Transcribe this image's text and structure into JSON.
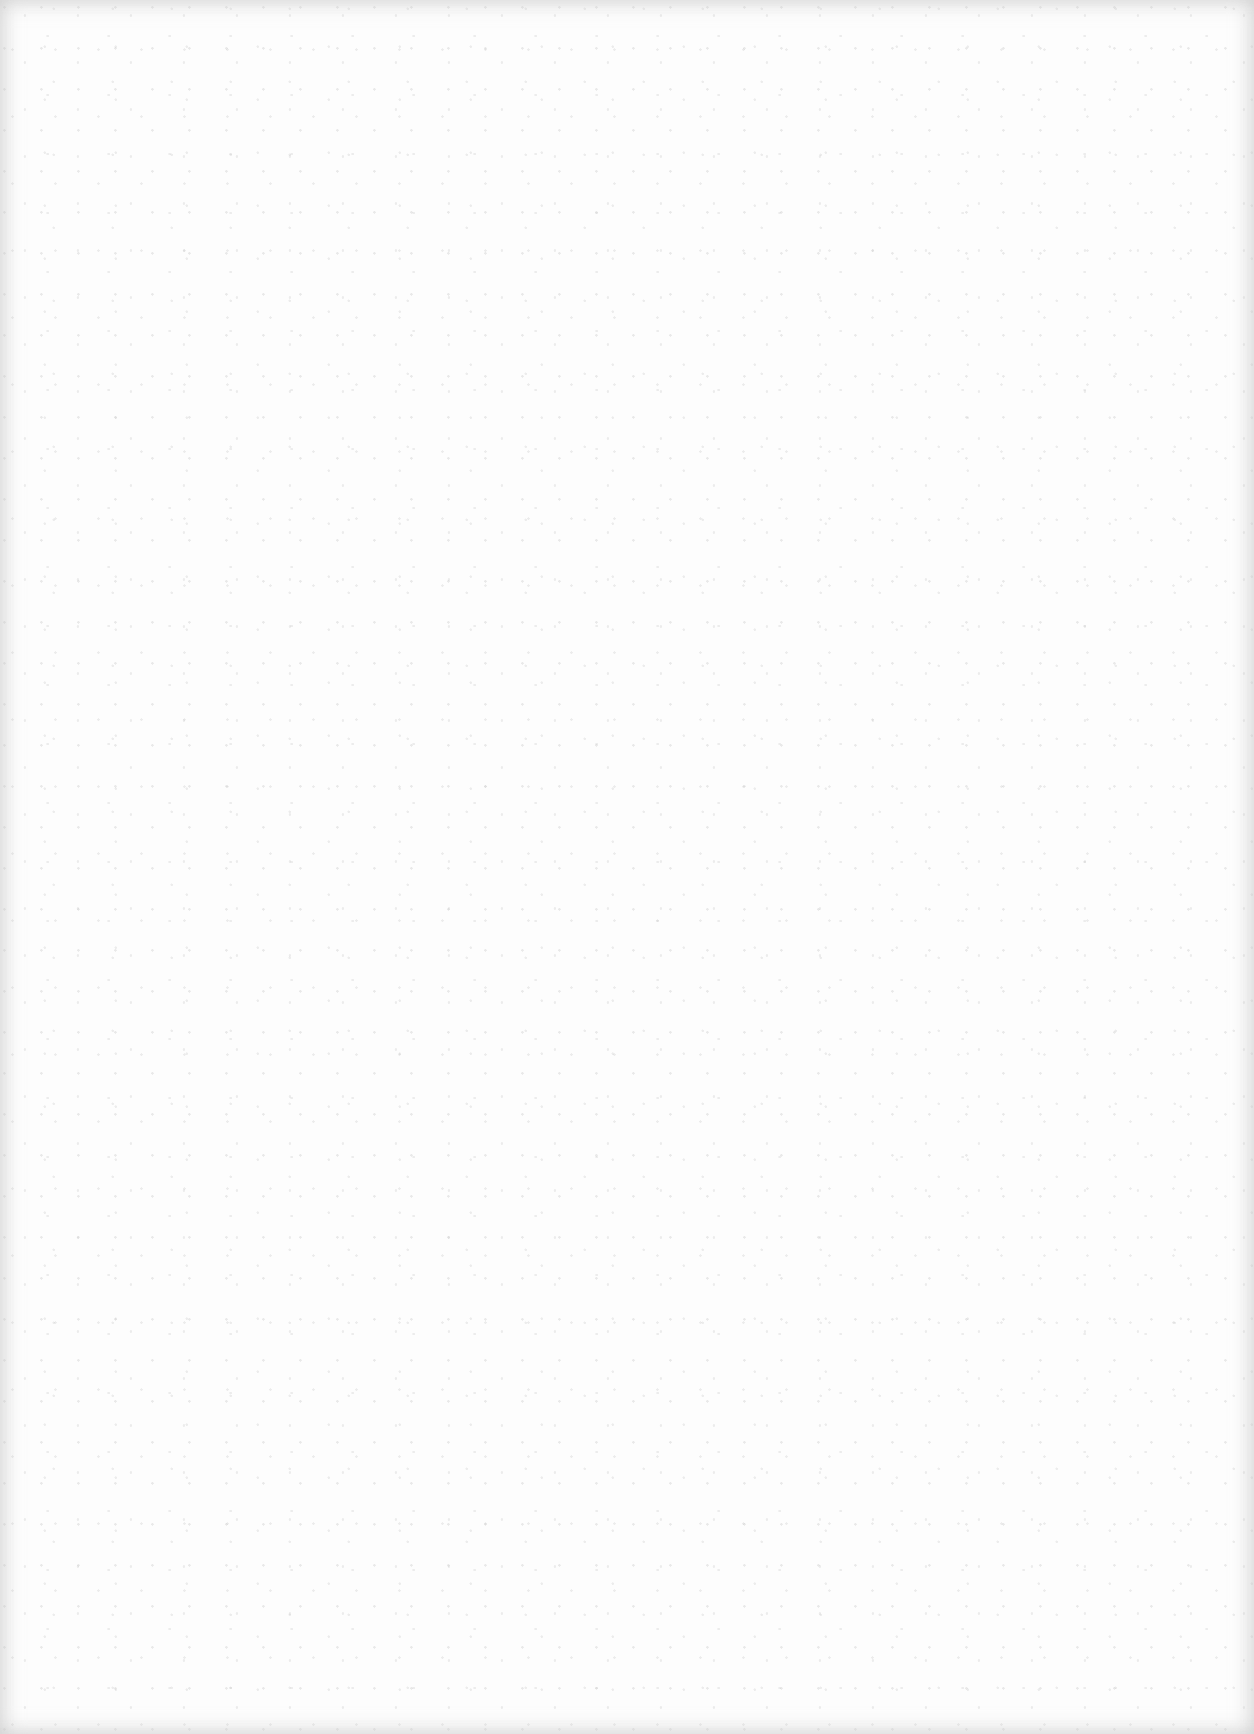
{
  "document": {
    "type": "blank-scanned-page",
    "text_content": "",
    "paper_color": "#fdfdfd",
    "edge_shade_color": "#c8c8c8"
  }
}
